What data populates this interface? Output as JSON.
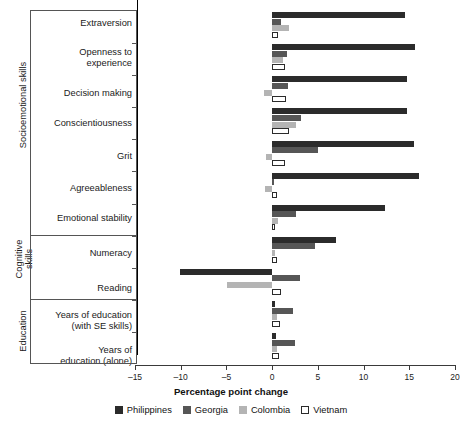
{
  "chart_data": {
    "type": "bar",
    "orientation": "horizontal",
    "title": "",
    "xlabel": "Percentage point change",
    "ylabel": "",
    "xlim": [
      -15,
      20
    ],
    "xticks": [
      -15,
      -10,
      -5,
      0,
      5,
      10,
      15,
      20
    ],
    "xticklabels": [
      "–15",
      "–10",
      "–5",
      "0",
      "5",
      "10",
      "15",
      "20"
    ],
    "grid": false,
    "legend_position": "bottom",
    "zero_reference_line": true,
    "groups": [
      {
        "name": "Socioemotional skills",
        "categories": [
          "Extraversion",
          "Openness to experience",
          "Decision making",
          "Conscientiousness",
          "Grit",
          "Agreeableness",
          "Emotional stability"
        ]
      },
      {
        "name": "Cognitive skills",
        "categories": [
          "Numeracy",
          "Reading"
        ]
      },
      {
        "name": "Education",
        "categories": [
          "Years of education (with SE skills)",
          "Years of education (alone)"
        ]
      }
    ],
    "categories": [
      "Extraversion",
      "Openness to experience",
      "Decision making",
      "Conscientiousness",
      "Grit",
      "Agreeableness",
      "Emotional stability",
      "Numeracy",
      "Reading",
      "Years of education (with SE skills)",
      "Years of education (alone)"
    ],
    "series": [
      {
        "name": "Philippines",
        "color": "#2b2b2b",
        "values": [
          14.5,
          15.6,
          14.7,
          14.8,
          15.5,
          16.1,
          12.3,
          7.0,
          -10.1,
          0.3,
          0.4
        ]
      },
      {
        "name": "Georgia",
        "color": "#565656",
        "values": [
          1.0,
          1.6,
          1.7,
          3.2,
          5.0,
          0.0,
          2.6,
          4.7,
          3.0,
          2.3,
          2.5
        ]
      },
      {
        "name": "Colombia",
        "color": "#b4b4b4",
        "values": [
          1.8,
          1.2,
          -0.9,
          2.6,
          -0.7,
          -0.8,
          0.6,
          0.3,
          -4.9,
          0.5,
          0.5
        ]
      },
      {
        "name": "Vietnam",
        "color": "#ffffff",
        "values": [
          0.6,
          1.4,
          1.5,
          1.9,
          1.4,
          0.5,
          0.3,
          0.5,
          1.0,
          0.9,
          0.8
        ]
      }
    ],
    "legend": [
      {
        "label": "Philippines",
        "swatch": "filled-dark"
      },
      {
        "label": "Georgia",
        "swatch": "filled-medium"
      },
      {
        "label": "Colombia",
        "swatch": "filled-light"
      },
      {
        "label": "Vietnam",
        "swatch": "outline"
      }
    ]
  },
  "labels": {
    "cat_0": "Extraversion",
    "cat_1_line1": "Openness to",
    "cat_1_line2": "experience",
    "cat_2": "Decision making",
    "cat_3": "Conscientiousness",
    "cat_4": "Grit",
    "cat_5": "Agreeableness",
    "cat_6": "Emotional stability",
    "cat_7": "Numeracy",
    "cat_8": "Reading",
    "cat_9_line1": "Years of education",
    "cat_9_line2": "(with SE skills)",
    "cat_10_line1": "Years of",
    "cat_10_line2": "education (alone)",
    "block_0": "Socioemotional skills",
    "block_1_line1": "Cognitive",
    "block_1_line2": "skills",
    "block_2": "Education",
    "axis_title": "Percentage point change",
    "tick_m15": "–15",
    "tick_m10": "–10",
    "tick_m5": "–5",
    "tick_0": "0",
    "tick_5": "5",
    "tick_10": "10",
    "tick_15": "15",
    "tick_20": "20",
    "legend_philippines": "Philippines",
    "legend_georgia": "Georgia",
    "legend_colombia": "Colombia",
    "legend_vietnam": "Vietnam"
  }
}
